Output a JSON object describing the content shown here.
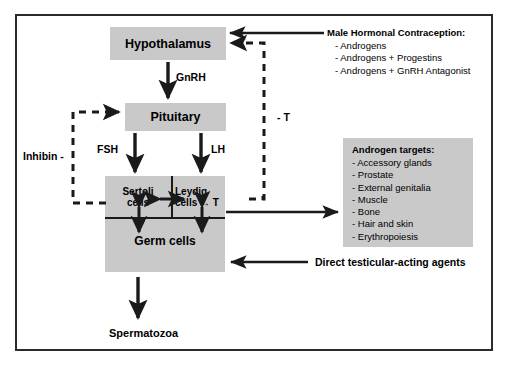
{
  "figure": {
    "frame_border_color": "#2b2b2b",
    "box_fill_color": "#c9c9c9",
    "line_color": "#1a1a1a",
    "background_color": "#ffffff"
  },
  "nodes": {
    "hypothalamus": {
      "label": "Hypothalamus"
    },
    "pituitary": {
      "label": "Pituitary"
    },
    "sertoli": {
      "label": "Sertoli\ncells",
      "line1": "Sertoli",
      "line2": "cells"
    },
    "leydig": {
      "label": "Leydig\ncells → T",
      "line1": "Leydig",
      "line2": "cells → T"
    },
    "germ": {
      "label": "Germ cells"
    },
    "spermatozoa": {
      "label": "Spermatozoa"
    }
  },
  "edge_labels": {
    "gnrh": "GnRH",
    "fsh": "FSH",
    "lh": "LH",
    "inhibin": "Inhibin -",
    "testosterone_feedback": "- T"
  },
  "panels": {
    "contraception": {
      "title": "Male Hormonal Contraception:",
      "items": [
        "- Androgens",
        "- Androgens + Progestins",
        "- Androgens + GnRH Antagonist"
      ]
    },
    "androgen_targets": {
      "title": "Androgen targets:",
      "items": [
        "- Accessory glands",
        "- Prostate",
        "- External genitalia",
        "- Muscle",
        "- Bone",
        "- Hair and skin",
        "- Erythropoiesis"
      ]
    },
    "direct_agents": {
      "label": "Direct testicular-acting agents"
    }
  }
}
